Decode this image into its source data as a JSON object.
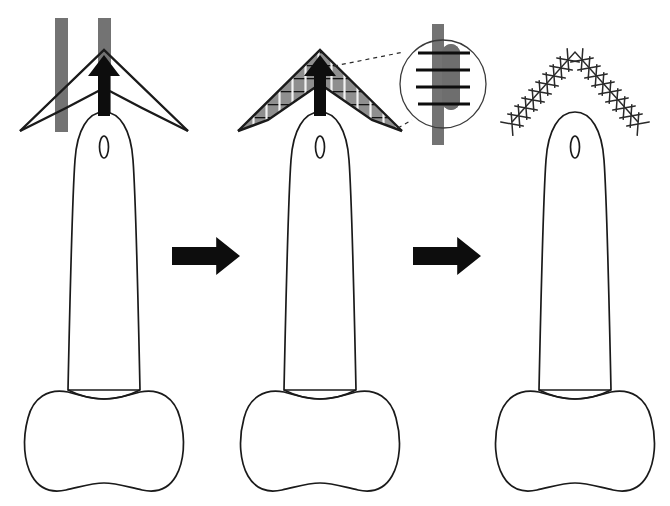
{
  "figure": {
    "type": "surgical-procedure-diagram",
    "background_color": "#ffffff",
    "stroke_color": "#1a1a1a",
    "band_gray": "#737373",
    "flap_gray": "#8a8a8a",
    "inset_dark_gray": "#6e6e6e",
    "step_count": 3
  },
  "panels": [
    {
      "id": "panel-1",
      "step_label": "1",
      "description": "V-shaped flap outlined over two vertical tissue bands with upward advancement arrow",
      "center_x": 104,
      "has_bands": true,
      "has_arrow": true,
      "has_hatching": false,
      "has_inset": false,
      "has_sutures": false,
      "band_left_x": 55,
      "band_right_x": 98,
      "band_width": 13,
      "band_top_y": 18,
      "band_bottom_y": 132,
      "chevron_apex": {
        "x": 104,
        "y": 50
      },
      "chevron_left_tip": {
        "x": 20,
        "y": 131
      },
      "chevron_right_tip": {
        "x": 155,
        "y": 131
      },
      "arrow_label": "advancement-direction"
    },
    {
      "id": "panel-2",
      "step_label": "2",
      "description": "Flap limbs shaded and transfixed by horizontal suture lines, with magnified circular inset of suture detail",
      "center_x": 320,
      "has_bands": false,
      "has_arrow": true,
      "has_hatching": true,
      "has_inset": true,
      "has_sutures": true,
      "chevron_apex": {
        "x": 320,
        "y": 50
      },
      "chevron_left_tip": {
        "x": 238,
        "y": 131
      },
      "chevron_right_tip": {
        "x": 372,
        "y": 131
      },
      "inset": {
        "center_x": 443,
        "center_y": 84,
        "radius_x": 43,
        "radius_y": 44,
        "suture_line_count": 4,
        "label": "magnified-suture-detail",
        "band_x": 432,
        "band_width": 12,
        "band_top_y": 24,
        "band_bottom_y": 145,
        "flap_edge_x": 442,
        "flap_edge_width": 18
      },
      "leader_lines": 2
    },
    {
      "id": "panel-3",
      "step_label": "3",
      "description": "Closed chevron incision line secured with interrupted cross sutures",
      "center_x": 575,
      "has_bands": false,
      "has_arrow": false,
      "has_hatching": false,
      "has_inset": false,
      "has_sutures": true,
      "chevron_apex": {
        "x": 575,
        "y": 52
      },
      "chevron_left_tip": {
        "x": 512,
        "y": 122
      },
      "chevron_right_tip": {
        "x": 640,
        "y": 122
      },
      "suture_marks_per_limb": 9,
      "suture_style": "cross"
    }
  ],
  "anatomy": {
    "label": "anatomical-structure",
    "description": "Elongated rounded shaft tapering to a bulbous lobed base with a small oval aperture near the tip",
    "tip_oval": {
      "rx": 4.5,
      "ry": 11,
      "offset_y": 147
    },
    "shaft_top_y": 112,
    "shaft_bottom_y": 388,
    "base_top_y": 385,
    "base_bottom_y": 492,
    "base_half_width": 72
  },
  "arrows": [
    {
      "id": "flow-arrow-1",
      "label": "step-1-to-step-2",
      "x": 172,
      "y": 237,
      "width": 68,
      "height": 38,
      "direction": "right",
      "color": "#0d0d0d"
    },
    {
      "id": "flow-arrow-2",
      "label": "step-2-to-step-3",
      "x": 413,
      "y": 237,
      "width": 68,
      "height": 38,
      "direction": "right",
      "color": "#0d0d0d"
    }
  ],
  "advancement_arrows": [
    {
      "id": "advancement-arrow-1",
      "panel": "panel-1",
      "x": 104,
      "tail_y": 116,
      "head_y": 57
    },
    {
      "id": "advancement-arrow-2",
      "panel": "panel-2",
      "x": 320,
      "tail_y": 116,
      "head_y": 57
    }
  ]
}
